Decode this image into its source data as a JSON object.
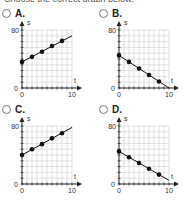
{
  "prompt_fragment": "Choose the correct graph below.",
  "options": [
    {
      "letter": "A."
    },
    {
      "letter": "B."
    },
    {
      "letter": "C."
    },
    {
      "letter": "D."
    }
  ],
  "chart_data": [
    {
      "type": "line",
      "title": "A.",
      "xlabel": "t",
      "ylabel": "s",
      "xlim": [
        0,
        10
      ],
      "ylim": [
        0,
        80
      ],
      "x_ticks": [
        "0",
        "10"
      ],
      "y_ticks": [
        "0",
        "80"
      ],
      "grid": true,
      "line": {
        "x": [
          0,
          10
        ],
        "y": [
          36,
          72
        ]
      },
      "points": {
        "x": [
          0,
          2,
          4,
          6,
          8
        ],
        "y": [
          36,
          43,
          50,
          58,
          65
        ]
      }
    },
    {
      "type": "line",
      "title": "B.",
      "xlabel": "t",
      "ylabel": "s",
      "xlim": [
        0,
        10
      ],
      "ylim": [
        0,
        80
      ],
      "x_ticks": [
        "0",
        "10"
      ],
      "y_ticks": [
        "0",
        "80"
      ],
      "grid": true,
      "line": {
        "x": [
          0,
          10
        ],
        "y": [
          45,
          0
        ]
      },
      "points": {
        "x": [
          0,
          2,
          4,
          6,
          8
        ],
        "y": [
          45,
          36,
          27,
          18,
          9
        ]
      }
    },
    {
      "type": "line",
      "title": "C.",
      "xlabel": "t",
      "ylabel": "s",
      "xlim": [
        0,
        10
      ],
      "ylim": [
        0,
        80
      ],
      "x_ticks": [
        "0",
        "10"
      ],
      "y_ticks": [
        "0",
        "80"
      ],
      "grid": true,
      "line": {
        "x": [
          0,
          10
        ],
        "y": [
          40,
          78
        ]
      },
      "points": {
        "x": [
          0,
          2,
          4,
          6,
          8
        ],
        "y": [
          40,
          48,
          55,
          63,
          70
        ]
      }
    },
    {
      "type": "line",
      "title": "D.",
      "xlabel": "t",
      "ylabel": "s",
      "xlim": [
        0,
        10
      ],
      "ylim": [
        0,
        80
      ],
      "x_ticks": [
        "0",
        "10"
      ],
      "y_ticks": [
        "0",
        "80"
      ],
      "grid": true,
      "line": {
        "x": [
          0,
          10
        ],
        "y": [
          45,
          5
        ]
      },
      "points": {
        "x": [
          0,
          2,
          4,
          6,
          8
        ],
        "y": [
          45,
          37,
          29,
          21,
          13
        ]
      }
    }
  ]
}
